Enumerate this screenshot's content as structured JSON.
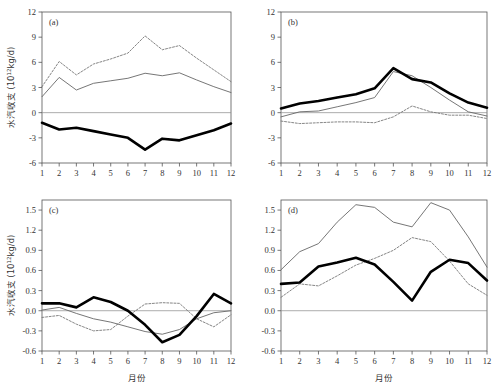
{
  "figure": {
    "width": 500,
    "height": 391,
    "background": "#ffffff",
    "top_cropped_text": "",
    "axis_color": "#555555",
    "zero_line_color": "#888888"
  },
  "axes": {
    "x_label": "月份",
    "y_label_cjk": "水汽收支",
    "y_label_unit_base": "(10",
    "y_label_unit_exp": "12",
    "y_label_unit_tail": "kg/d)",
    "months": [
      "1",
      "2",
      "3",
      "4",
      "5",
      "6",
      "7",
      "8",
      "9",
      "10",
      "11",
      "12"
    ]
  },
  "series_styles": {
    "thick": {
      "name": "thick-solid",
      "color": "#000000",
      "width": 2.6,
      "dash": "none"
    },
    "thin": {
      "name": "thin-solid",
      "color": "#666666",
      "width": 0.9,
      "dash": "none"
    },
    "dashed": {
      "name": "thin-dashed",
      "color": "#777777",
      "width": 0.9,
      "dash": "2,1.6"
    }
  },
  "chart_data": [
    {
      "type": "line",
      "panel": "(a)",
      "title": "",
      "xlabel": "",
      "ylabel": "水汽收支 (10^12 kg/d)",
      "x": [
        1,
        2,
        3,
        4,
        5,
        6,
        7,
        8,
        9,
        10,
        11,
        12
      ],
      "xlim": [
        1,
        12
      ],
      "ylim": [
        -6,
        12
      ],
      "yticks": [
        -6,
        -3,
        0,
        3,
        6,
        9,
        12
      ],
      "ytick_labels": [
        "-6",
        "-3",
        "0",
        "3",
        "6",
        "9",
        "12"
      ],
      "grid": false,
      "legend": "none",
      "series": [
        {
          "name": "thick",
          "values": [
            -1.2,
            -2.0,
            -1.8,
            -2.2,
            -2.6,
            -3.0,
            -4.4,
            -3.1,
            -3.3,
            -2.7,
            -2.1,
            -1.3
          ]
        },
        {
          "name": "thin",
          "values": [
            1.9,
            4.2,
            2.7,
            3.5,
            3.8,
            4.1,
            4.7,
            4.4,
            4.75,
            3.9,
            3.1,
            2.4
          ]
        },
        {
          "name": "dashed",
          "values": [
            3.1,
            6.1,
            4.5,
            5.8,
            6.4,
            7.1,
            9.15,
            7.5,
            8.0,
            6.5,
            5.1,
            3.7
          ]
        }
      ]
    },
    {
      "type": "line",
      "panel": "(b)",
      "title": "",
      "xlabel": "",
      "ylabel": "",
      "x": [
        1,
        2,
        3,
        4,
        5,
        6,
        7,
        8,
        9,
        10,
        11,
        12
      ],
      "xlim": [
        1,
        12
      ],
      "ylim": [
        -6,
        12
      ],
      "yticks": [
        -6,
        -3,
        0,
        3,
        6,
        9,
        12
      ],
      "ytick_labels": [
        "-6",
        "-3",
        "0",
        "3",
        "6",
        "9",
        "12"
      ],
      "grid": false,
      "legend": "none",
      "series": [
        {
          "name": "thick",
          "values": [
            0.5,
            1.1,
            1.4,
            1.8,
            2.2,
            2.9,
            5.3,
            4.0,
            3.6,
            2.3,
            1.2,
            0.6
          ]
        },
        {
          "name": "thin",
          "values": [
            -0.5,
            0.1,
            0.2,
            0.7,
            1.2,
            1.8,
            4.9,
            4.4,
            3.0,
            1.5,
            0.1,
            -0.4
          ]
        },
        {
          "name": "dashed",
          "values": [
            -1.0,
            -1.3,
            -1.2,
            -1.1,
            -1.1,
            -1.2,
            -0.5,
            0.8,
            0.1,
            -0.3,
            -0.3,
            -0.7
          ]
        }
      ]
    },
    {
      "type": "line",
      "panel": "(c)",
      "title": "",
      "xlabel": "月份",
      "ylabel": "水汽收支 (10^12 kg/d)",
      "x": [
        1,
        2,
        3,
        4,
        5,
        6,
        7,
        8,
        9,
        10,
        11,
        12
      ],
      "xlim": [
        1,
        12
      ],
      "ylim": [
        -0.6,
        1.65
      ],
      "yticks": [
        -0.6,
        -0.3,
        0.0,
        0.3,
        0.6,
        0.9,
        1.2,
        1.5
      ],
      "ytick_labels": [
        "-0.6",
        "-0.3",
        "0.0",
        "0.3",
        "0.6",
        "0.9",
        "1.2",
        "1.5"
      ],
      "grid": false,
      "legend": "none",
      "series": [
        {
          "name": "thick",
          "values": [
            0.11,
            0.11,
            0.05,
            0.2,
            0.13,
            0.0,
            -0.21,
            -0.47,
            -0.36,
            -0.08,
            0.25,
            0.11
          ]
        },
        {
          "name": "thin",
          "values": [
            0.01,
            0.05,
            -0.04,
            -0.12,
            -0.17,
            -0.24,
            -0.31,
            -0.35,
            -0.28,
            -0.12,
            -0.03,
            0.0
          ]
        },
        {
          "name": "dashed",
          "values": [
            -0.1,
            -0.07,
            -0.2,
            -0.3,
            -0.28,
            -0.08,
            0.1,
            0.12,
            0.11,
            -0.12,
            -0.24,
            -0.06
          ]
        }
      ]
    },
    {
      "type": "line",
      "panel": "(d)",
      "title": "",
      "xlabel": "月份",
      "ylabel": "",
      "x": [
        1,
        2,
        3,
        4,
        5,
        6,
        7,
        8,
        9,
        10,
        11,
        12
      ],
      "xlim": [
        1,
        12
      ],
      "ylim": [
        -0.6,
        1.65
      ],
      "yticks": [
        -0.6,
        -0.3,
        0.0,
        0.3,
        0.6,
        0.9,
        1.2,
        1.5
      ],
      "ytick_labels": [
        "-0.6",
        "-0.3",
        "0.0",
        "0.3",
        "0.6",
        "0.9",
        "1.2",
        "1.5"
      ],
      "grid": false,
      "legend": "none",
      "series": [
        {
          "name": "thick",
          "values": [
            0.4,
            0.42,
            0.66,
            0.72,
            0.79,
            0.69,
            0.43,
            0.15,
            0.58,
            0.76,
            0.71,
            0.45
          ]
        },
        {
          "name": "thin",
          "values": [
            0.61,
            0.88,
            1.0,
            1.32,
            1.58,
            1.54,
            1.32,
            1.25,
            1.61,
            1.5,
            1.1,
            0.65
          ]
        },
        {
          "name": "dashed",
          "values": [
            0.2,
            0.4,
            0.37,
            0.52,
            0.68,
            0.78,
            0.9,
            1.09,
            1.03,
            0.74,
            0.4,
            0.23
          ]
        }
      ]
    }
  ]
}
